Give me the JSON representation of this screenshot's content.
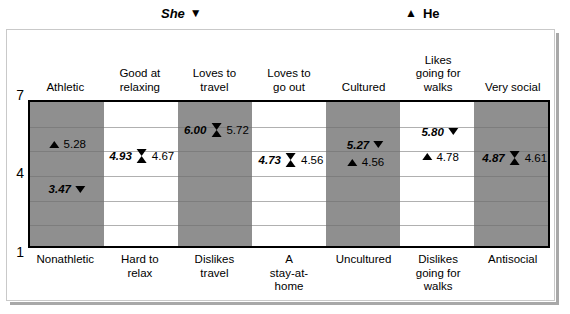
{
  "legend": {
    "she_label": "She",
    "she_glyph": "▼",
    "he_label": "He",
    "he_glyph": "▲"
  },
  "axis": {
    "top_label": "7",
    "mid_label": "4",
    "bottom_label": "1"
  },
  "colors": {
    "shaded_column": "#8f8f8f",
    "plain_column": "#ffffff",
    "marker": "#000000",
    "frame": "#000000",
    "gridline": "#6f6f6f"
  },
  "chart_data": {
    "type": "scatter",
    "title": "",
    "xlabel": "",
    "ylabel": "",
    "ylim": [
      1,
      7
    ],
    "grid": true,
    "legend_position": "top",
    "categories": [
      "Athletic",
      "Good at relaxing",
      "Loves to travel",
      "Loves to go out",
      "Cultured",
      "Likes going for walks",
      "Very social"
    ],
    "categories_opposite": [
      "Nonathletic",
      "Hard to relax",
      "Dislikes travel",
      "A stay-at-home",
      "Uncultured",
      "Dislikes going for walks",
      "Antisocial"
    ],
    "series": [
      {
        "name": "She",
        "glyph": "▼",
        "values": [
          3.47,
          4.93,
          6.0,
          4.73,
          5.27,
          5.8,
          4.87
        ]
      },
      {
        "name": "He",
        "glyph": "▲",
        "values": [
          5.28,
          4.67,
          5.72,
          4.56,
          4.56,
          4.78,
          4.61
        ]
      }
    ],
    "points": [
      {
        "column": 0,
        "she": "3.47",
        "he": "5.28",
        "combined": false,
        "she_text_side": "left",
        "he_text_side": "right"
      },
      {
        "column": 1,
        "she": "4.93",
        "he": "4.67",
        "combined": true,
        "she_text_side": "left",
        "he_text_side": "right"
      },
      {
        "column": 2,
        "she": "6.00",
        "he": "5.72",
        "combined": true,
        "she_text_side": "left",
        "he_text_side": "right"
      },
      {
        "column": 3,
        "she": "4.73",
        "he": "4.56",
        "combined": true,
        "she_text_side": "left",
        "he_text_side": "right"
      },
      {
        "column": 4,
        "she": "5.27",
        "he": "4.56",
        "combined": false,
        "she_text_side": "left",
        "he_text_side": "right"
      },
      {
        "column": 5,
        "she": "5.80",
        "he": "4.78",
        "combined": false,
        "she_text_side": "left",
        "he_text_side": "right"
      },
      {
        "column": 6,
        "she": "4.87",
        "he": "4.61",
        "combined": true,
        "she_text_side": "left",
        "he_text_side": "right"
      }
    ]
  },
  "top_labels": [
    "Athletic",
    "Good at\nrelaxing",
    "Loves to\ntravel",
    "Loves to\ngo out",
    "Cultured",
    "Likes\ngoing for\nwalks",
    "Very social"
  ],
  "bottom_labels": [
    "Nonathletic",
    "Hard to\nrelax",
    "Dislikes\ntravel",
    "A\nstay-at-\nhome",
    "Uncultured",
    "Dislikes\ngoing for\nwalks",
    "Antisocial"
  ]
}
